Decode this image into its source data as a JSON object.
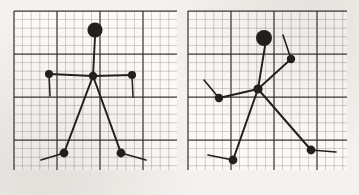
{
  "document": {
    "title": "Stick figure pose skeletons on graph paper",
    "description": "Two hand-drawn articulated stick-figure skeletons sketched on squared graph paper, side by side",
    "background_color": "#f4f2ee",
    "ink_color": "#241f1c",
    "grid": {
      "minor_color": "#6f6a63",
      "major_color": "#2b2724",
      "minor_spacing": 8.6,
      "major_every": 5,
      "minor_width": 0.55,
      "major_width": 1.25
    }
  },
  "panels": [
    {
      "name": "left-panel",
      "label": "Pose A - symmetric standing figure",
      "x": 14,
      "y": 11,
      "width": 163,
      "height": 159,
      "figure": {
        "name": "stick-figure-a",
        "head": {
          "label": "head",
          "cx": 95,
          "cy": 30,
          "r": 7.6
        },
        "joints": [
          {
            "name": "torso-hub",
            "label": "chest joint",
            "cx": 93,
            "cy": 76,
            "r": 4.2
          },
          {
            "name": "hand-left",
            "label": "left hand joint",
            "cx": 49,
            "cy": 74,
            "r": 4.0
          },
          {
            "name": "hand-right",
            "label": "right hand joint",
            "cx": 132,
            "cy": 75,
            "r": 4.0
          },
          {
            "name": "foot-left",
            "label": "left foot joint",
            "cx": 64,
            "cy": 153,
            "r": 4.4
          },
          {
            "name": "foot-right",
            "label": "right foot joint",
            "cx": 121,
            "cy": 153,
            "r": 4.4
          }
        ],
        "bones": [
          {
            "name": "neck",
            "label": "head to chest",
            "x1": 95,
            "y1": 37,
            "x2": 93,
            "y2": 76,
            "w": 1.9
          },
          {
            "name": "arm-left",
            "label": "chest to left hand",
            "x1": 93,
            "y1": 76,
            "x2": 49,
            "y2": 74,
            "w": 1.9
          },
          {
            "name": "arm-right",
            "label": "chest to right hand",
            "x1": 93,
            "y1": 76,
            "x2": 132,
            "y2": 75,
            "w": 1.9
          },
          {
            "name": "leg-left",
            "label": "chest to left foot",
            "x1": 93,
            "y1": 76,
            "x2": 64,
            "y2": 153,
            "w": 2.0
          },
          {
            "name": "leg-right",
            "label": "chest to right foot",
            "x1": 93,
            "y1": 76,
            "x2": 121,
            "y2": 153,
            "w": 2.0
          }
        ],
        "tails": [
          {
            "name": "tail-hand-left",
            "label": "left forearm stub",
            "x1": 49,
            "y1": 74,
            "x2": 50,
            "y2": 96,
            "w": 1.5
          },
          {
            "name": "tail-hand-right",
            "label": "right forearm stub",
            "x1": 132,
            "y1": 75,
            "x2": 133,
            "y2": 97,
            "w": 1.5
          },
          {
            "name": "tail-foot-left",
            "label": "left foot stub",
            "x1": 64,
            "y1": 153,
            "x2": 41,
            "y2": 160,
            "w": 1.7
          },
          {
            "name": "tail-foot-right",
            "label": "right foot stub",
            "x1": 121,
            "y1": 153,
            "x2": 146,
            "y2": 160,
            "w": 1.7
          }
        ]
      }
    },
    {
      "name": "right-panel",
      "label": "Pose B - asymmetric striding figure",
      "x": 188,
      "y": 11,
      "width": 159,
      "height": 159,
      "figure": {
        "name": "stick-figure-b",
        "head": {
          "label": "head",
          "cx": 264,
          "cy": 38,
          "r": 8.0
        },
        "joints": [
          {
            "name": "torso-hub",
            "label": "chest joint",
            "cx": 258,
            "cy": 89,
            "r": 4.6
          },
          {
            "name": "hand-left",
            "label": "left hand joint",
            "cx": 219,
            "cy": 98,
            "r": 4.2
          },
          {
            "name": "hand-right",
            "label": "right hand joint",
            "cx": 291,
            "cy": 59,
            "r": 4.2
          },
          {
            "name": "foot-left",
            "label": "left foot joint",
            "cx": 233,
            "cy": 160,
            "r": 4.4
          },
          {
            "name": "foot-right",
            "label": "right foot joint",
            "cx": 311,
            "cy": 150,
            "r": 4.4
          }
        ],
        "bones": [
          {
            "name": "neck",
            "label": "head to chest",
            "x1": 265,
            "y1": 46,
            "x2": 258,
            "y2": 89,
            "w": 1.9
          },
          {
            "name": "arm-left",
            "label": "chest to left hand",
            "x1": 258,
            "y1": 89,
            "x2": 219,
            "y2": 98,
            "w": 1.9
          },
          {
            "name": "arm-right",
            "label": "chest to right hand",
            "x1": 258,
            "y1": 89,
            "x2": 291,
            "y2": 59,
            "w": 1.9
          },
          {
            "name": "leg-left",
            "label": "chest to left foot",
            "x1": 258,
            "y1": 89,
            "x2": 233,
            "y2": 160,
            "w": 2.0
          },
          {
            "name": "leg-right",
            "label": "chest to right foot",
            "x1": 258,
            "y1": 89,
            "x2": 311,
            "y2": 150,
            "w": 2.0
          }
        ],
        "tails": [
          {
            "name": "tail-hand-left",
            "label": "left forearm stub",
            "x1": 219,
            "y1": 98,
            "x2": 204,
            "y2": 80,
            "w": 1.6
          },
          {
            "name": "tail-hand-right",
            "label": "right forearm stub",
            "x1": 291,
            "y1": 59,
            "x2": 283,
            "y2": 35,
            "w": 1.6
          },
          {
            "name": "tail-foot-left",
            "label": "left foot stub",
            "x1": 233,
            "y1": 160,
            "x2": 208,
            "y2": 155,
            "w": 1.7
          },
          {
            "name": "tail-foot-right",
            "label": "right foot stub",
            "x1": 311,
            "y1": 150,
            "x2": 336,
            "y2": 152,
            "w": 1.7
          }
        ]
      }
    }
  ]
}
